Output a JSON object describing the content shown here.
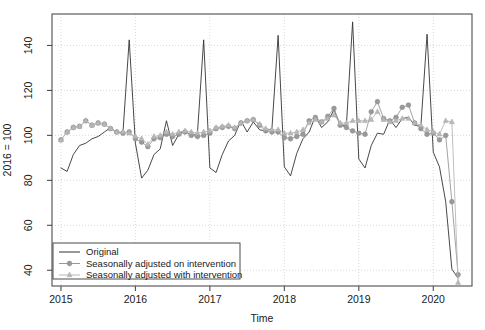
{
  "chart_data": {
    "type": "line",
    "title": "",
    "xlabel": "Time",
    "ylabel": "2016 = 100",
    "xlim": [
      2014.88,
      2020.52
    ],
    "ylim": [
      33,
      154
    ],
    "grid": true,
    "legend_position": "bottom-left",
    "x_ticks": [
      2015,
      2016,
      2017,
      2018,
      2019,
      2020
    ],
    "x_tick_labels": [
      "2015",
      "2016",
      "2017",
      "2018",
      "2019",
      "2020"
    ],
    "y_ticks": [
      40,
      60,
      80,
      100,
      120,
      140
    ],
    "y_tick_labels": [
      "40",
      "60",
      "80",
      "100",
      "120",
      "140"
    ],
    "x": [
      2015.0,
      2015.0833,
      2015.1667,
      2015.25,
      2015.3333,
      2015.4167,
      2015.5,
      2015.5833,
      2015.6667,
      2015.75,
      2015.8333,
      2015.9167,
      2016.0,
      2016.0833,
      2016.1667,
      2016.25,
      2016.3333,
      2016.4167,
      2016.5,
      2016.5833,
      2016.6667,
      2016.75,
      2016.8333,
      2016.9167,
      2017.0,
      2017.0833,
      2017.1667,
      2017.25,
      2017.3333,
      2017.4167,
      2017.5,
      2017.5833,
      2017.6667,
      2017.75,
      2017.8333,
      2017.9167,
      2018.0,
      2018.0833,
      2018.1667,
      2018.25,
      2018.3333,
      2018.4167,
      2018.5,
      2018.5833,
      2018.6667,
      2018.75,
      2018.8333,
      2018.9167,
      2019.0,
      2019.0833,
      2019.1667,
      2019.25,
      2019.3333,
      2019.4167,
      2019.5,
      2019.5833,
      2019.6667,
      2019.75,
      2019.8333,
      2019.9167,
      2020.0,
      2020.0833,
      2020.1667,
      2020.25,
      2020.3333
    ],
    "series": [
      {
        "name": "Original",
        "style": "line",
        "color": "#333333",
        "marker": "none",
        "values": [
          85.5,
          84.0,
          91.5,
          95.5,
          96.5,
          98.5,
          99.5,
          101.5,
          103.5,
          101.0,
          101.5,
          142.5,
          96.5,
          81.0,
          84.5,
          91.5,
          94.0,
          106.5,
          95.5,
          100.5,
          102.5,
          99.5,
          101.0,
          142.5,
          85.5,
          83.5,
          91.5,
          97.5,
          100.0,
          106.5,
          101.5,
          106.0,
          102.5,
          102.0,
          103.0,
          144.5,
          86.0,
          82.0,
          92.0,
          98.5,
          101.5,
          108.5,
          103.5,
          106.0,
          111.5,
          104.5,
          104.5,
          150.5,
          89.5,
          85.5,
          95.5,
          101.0,
          100.5,
          107.0,
          103.5,
          107.5,
          108.0,
          104.5,
          104.0,
          145.0,
          92.5,
          86.0,
          70.5,
          40.5,
          36.5
        ]
      },
      {
        "name": "Seasonally adjusted on intervention",
        "style": "line+marker",
        "color": "#999999",
        "marker": "circle",
        "values": [
          98.0,
          101.5,
          103.5,
          104.0,
          106.5,
          104.5,
          105.5,
          105.0,
          103.0,
          101.5,
          101.0,
          101.5,
          98.5,
          97.0,
          95.0,
          98.5,
          99.0,
          100.5,
          99.5,
          100.5,
          101.5,
          100.0,
          99.5,
          100.0,
          101.0,
          103.0,
          103.5,
          104.0,
          103.0,
          105.5,
          106.5,
          107.0,
          104.5,
          102.0,
          101.5,
          101.5,
          99.0,
          98.5,
          99.5,
          100.5,
          106.5,
          108.0,
          106.0,
          108.5,
          112.0,
          104.5,
          103.5,
          102.0,
          101.0,
          100.5,
          110.5,
          115.0,
          107.5,
          106.5,
          108.0,
          112.5,
          113.5,
          105.5,
          103.0,
          100.5,
          101.0,
          98.0,
          100.0,
          70.5,
          38.0
        ]
      },
      {
        "name": "Seasonally adjusted with intervention",
        "style": "line+marker",
        "color": "#b8b8b8",
        "marker": "triangle",
        "values": [
          98.0,
          101.5,
          103.5,
          104.0,
          106.5,
          104.5,
          105.5,
          105.0,
          103.0,
          101.5,
          101.5,
          101.0,
          99.5,
          98.5,
          96.0,
          99.5,
          100.0,
          101.5,
          100.5,
          101.5,
          102.0,
          101.5,
          101.0,
          101.5,
          102.0,
          103.5,
          104.0,
          104.5,
          103.5,
          105.5,
          106.5,
          107.0,
          105.0,
          103.0,
          102.5,
          102.5,
          101.0,
          101.0,
          101.5,
          102.5,
          105.5,
          107.0,
          106.0,
          107.5,
          109.0,
          105.5,
          105.5,
          106.5,
          106.5,
          106.5,
          107.0,
          110.5,
          107.0,
          106.0,
          106.5,
          107.5,
          107.5,
          105.5,
          104.5,
          102.5,
          101.5,
          100.5,
          106.5,
          106.0,
          34.5
        ]
      }
    ]
  },
  "legend": {
    "items": [
      {
        "label": "Original",
        "marker": "line"
      },
      {
        "label": "Seasonally adjusted on intervention",
        "marker": "circle"
      },
      {
        "label": "Seasonally adjusted with intervention",
        "marker": "triangle"
      }
    ]
  },
  "colors": {
    "original": "#333333",
    "adjusted_on": "#999999",
    "adjusted_with": "#b8b8b8",
    "axis": "#4d4d4d",
    "grid": "#d9d9d9",
    "background": "#ffffff"
  }
}
